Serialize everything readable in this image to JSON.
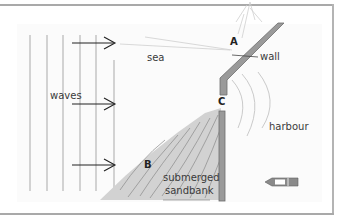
{
  "diagram": {
    "labels": {
      "sea": "sea",
      "waves": "waves",
      "wall": "wall",
      "harbour": "harbour",
      "point_a": "A",
      "point_b": "B",
      "point_c": "C",
      "sandbank_line1": "submerged",
      "sandbank_line2": "sandbank"
    },
    "colors": {
      "frame": "#a9a9a9",
      "wave_lines": "#b8b8b8",
      "arrows": "#222222",
      "wall_fill": "#9a9a9a",
      "wall_stroke": "#6e6e6e",
      "sandbank_fill": "#d2d2d2",
      "sandbank_hatch": "#8a8a8a",
      "ripples": "#c4c4c4",
      "boat": "#7a7a7a"
    },
    "icons": [
      "boat-icon",
      "arrow-right-icon"
    ]
  }
}
